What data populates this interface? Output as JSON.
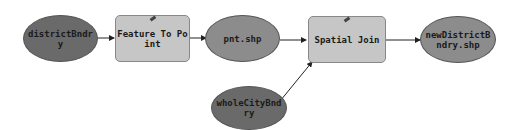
{
  "nodes": {
    "districtBndry": {
      "label": "districtBndr y",
      "type": "input-data"
    },
    "featureToPoint": {
      "label": "Feature To Point",
      "type": "tool"
    },
    "pntShp": {
      "label": "pnt.shp",
      "type": "derived-data"
    },
    "spatialJoin": {
      "label": "Spatial Join",
      "type": "tool"
    },
    "newDistrictBndry": {
      "label": "newDistrictB ndry.shp",
      "type": "derived-data"
    },
    "wholeCityBndry": {
      "label": "wholeCityBnd ry",
      "type": "input-data"
    }
  },
  "colors": {
    "input": "#6a6a6a",
    "derived": "#8c8c8c",
    "tool": "#c6c6c6",
    "edge": "#222222"
  }
}
